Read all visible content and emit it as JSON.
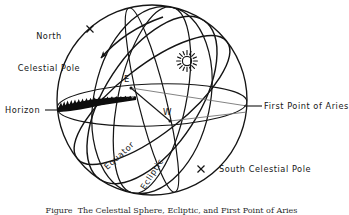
{
  "figure": {
    "caption": "Figure  The Celestial Sphere, Ecliptic, and First Point of Aries"
  },
  "labels": {
    "north_celestial_pole": {
      "line1": "North",
      "line2": "Celestial Pole"
    },
    "horizon": "Horizon",
    "first_point_of_aries": "First Point of Aries",
    "south_celestial_pole": "South Celestial Pole",
    "equator": "Equator",
    "ecliptic": "Ecliptic",
    "east_point": "E",
    "west_point": "W"
  },
  "icons": {
    "sun": "sun-icon",
    "rotation_arrow": "rotation-arrow-icon",
    "north_pole_marker": "x-marker-icon",
    "south_pole_marker": "x-marker-icon",
    "horizon_terrain": "terrain-silhouette-icon"
  },
  "colors": {
    "ink": "#151515",
    "background": "#ffffff",
    "terrain": "#0d0d0d"
  },
  "geometry": {
    "sphere_center_x": 152,
    "sphere_center_y": 100,
    "sphere_radius_x": 95,
    "sphere_radius_y": 95
  }
}
